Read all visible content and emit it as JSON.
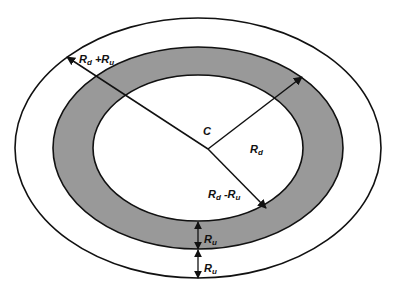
{
  "diagram": {
    "colors": {
      "background": "#ffffff",
      "ring_fill": "#999999",
      "stroke": "#111111"
    },
    "center_label": "C",
    "labels": {
      "outer_radius": {
        "main": "R",
        "sub1": "d",
        "op": " +R",
        "sub2": "u"
      },
      "middle_radius": {
        "main": "R",
        "sub1": "d"
      },
      "inner_radius": {
        "main": "R",
        "sub1": "d",
        "op": " -R",
        "sub2": "u"
      },
      "ring_width_upper": {
        "main": "R",
        "sub1": "u"
      },
      "ring_width_lower": {
        "main": "R",
        "sub1": "u"
      }
    },
    "ellipses": [
      {
        "name": "outer",
        "cx": 198,
        "cy": 148,
        "rx": 183,
        "ry": 130
      },
      {
        "name": "middle",
        "cx": 198,
        "cy": 148,
        "rx": 145,
        "ry": 101
      },
      {
        "name": "inner",
        "cx": 198,
        "cy": 148,
        "rx": 105,
        "ry": 73
      }
    ]
  }
}
